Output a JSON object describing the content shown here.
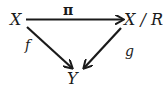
{
  "diagram": {
    "type": "commutative-triangle",
    "nodes": {
      "top_left": "X",
      "top_right": "X / R",
      "bottom": "Y"
    },
    "arrows": [
      {
        "from": "X",
        "to": "X / R",
        "label": "π"
      },
      {
        "from": "X",
        "to": "Y",
        "label": "f"
      },
      {
        "from": "X / R",
        "to": "Y",
        "label": "g"
      }
    ],
    "colors": {
      "ink": "#1a1a1a",
      "background": "#ffffff"
    }
  }
}
